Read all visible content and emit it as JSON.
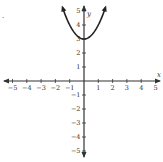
{
  "problem": {
    "marker": "."
  },
  "chart_data": {
    "type": "line",
    "title": "",
    "xlabel": "x",
    "ylabel": "y",
    "xlim": [
      -5,
      5
    ],
    "ylim": [
      -5,
      5
    ],
    "grid": false,
    "x_ticks": [
      -5,
      -4,
      -3,
      -2,
      -1,
      1,
      2,
      3,
      4,
      5
    ],
    "y_ticks": [
      -5,
      -4,
      -3,
      -2,
      -1,
      1,
      2,
      3,
      4,
      5
    ],
    "series": [
      {
        "name": "y = x^2 + 3",
        "function": "x^2 + 3",
        "x": [
          -1.5,
          -1.25,
          -1,
          -0.75,
          -0.5,
          -0.25,
          0,
          0.25,
          0.5,
          0.75,
          1,
          1.25,
          1.5
        ],
        "values": [
          5.25,
          4.5625,
          4,
          3.5625,
          3.25,
          3.0625,
          3,
          3.0625,
          3.25,
          3.5625,
          4,
          4.5625,
          5.25
        ],
        "arrows_at_ends": true,
        "vertex": [
          0,
          3
        ]
      }
    ],
    "axes_arrows": true
  },
  "colors": {
    "axis": "#333333",
    "curve": "#222222",
    "text": "#333333"
  }
}
